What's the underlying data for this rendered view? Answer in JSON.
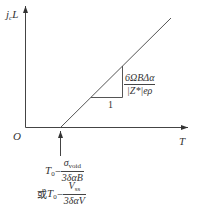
{
  "diagram": {
    "y_axis": {
      "label_main": "j",
      "label_sub": "c",
      "label_tail": "L"
    },
    "x_axis": {
      "label": "T"
    },
    "origin": {
      "label": "O"
    },
    "slope_triangle": {
      "run_label": "1",
      "rise_numerator": "6ΩBΔα",
      "rise_denominator": "|Z*|eρ"
    },
    "intercept": {
      "line1": {
        "prefix": "T",
        "prefix_sub": "0",
        "dash": "−",
        "numerator": "σ",
        "numerator_sub": "void",
        "denominator": "3δαB"
      },
      "connector": "或",
      "line2": {
        "prefix": "T",
        "prefix_sub": "0",
        "dash": "−",
        "numerator": "V",
        "numerator_sub": "ss",
        "denominator": "3δαV"
      }
    },
    "colors": {
      "stroke": "#444444",
      "background": "#ffffff"
    }
  }
}
